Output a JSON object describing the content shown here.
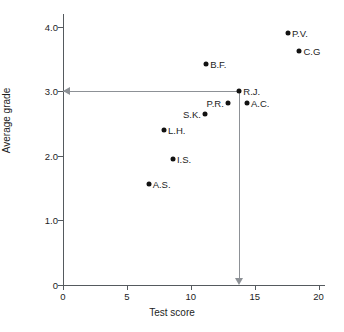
{
  "chart_data": {
    "type": "scatter",
    "title": "",
    "xlabel": "Test score",
    "ylabel": "Average grade",
    "xlim": [
      0,
      20.5
    ],
    "ylim": [
      0,
      4.2
    ],
    "xticks": [
      "0",
      "5",
      "10",
      "15",
      "20"
    ],
    "xtick_values": [
      0,
      5,
      10,
      15,
      20
    ],
    "yticks": [
      "0",
      "1.0",
      "2.0",
      "3.0",
      "4.0"
    ],
    "ytick_values": [
      0,
      1.0,
      2.0,
      3.0,
      4.0
    ],
    "grid": false,
    "legend": "none",
    "points": [
      {
        "label": "P.V.",
        "x": 17.6,
        "y": 3.9,
        "label_side": "right"
      },
      {
        "label": "C.G",
        "x": 18.5,
        "y": 3.62,
        "label_side": "right"
      },
      {
        "label": "B.F.",
        "x": 11.2,
        "y": 3.42,
        "label_side": "right"
      },
      {
        "label": "R.J.",
        "x": 13.8,
        "y": 3.0,
        "label_side": "right"
      },
      {
        "label": "A.C.",
        "x": 14.4,
        "y": 2.82,
        "label_side": "right"
      },
      {
        "label": "P.R.",
        "x": 12.9,
        "y": 2.82,
        "label_side": "left"
      },
      {
        "label": "S.K.",
        "x": 11.1,
        "y": 2.65,
        "label_side": "left"
      },
      {
        "label": "L.H.",
        "x": 7.9,
        "y": 2.4,
        "label_side": "right"
      },
      {
        "label": "I.S.",
        "x": 8.6,
        "y": 1.96,
        "label_side": "right"
      },
      {
        "label": "A.S.",
        "x": 6.7,
        "y": 1.57,
        "label_side": "right"
      }
    ],
    "annotations": [
      {
        "name": "guide-from-rj",
        "description": "Grey guide lines with arrowheads running from the R.J. data point left to the y-axis at 3.0 and down to the x-axis at 13.8",
        "from_point": "R.J.",
        "to_y_value": 3.0,
        "to_x_value": 13.8
      }
    ],
    "colors": {
      "point": "#121212",
      "axis": "#555a5e",
      "guide": "#8d9196",
      "text": "#1d1d1d",
      "background": "#ffffff"
    }
  }
}
